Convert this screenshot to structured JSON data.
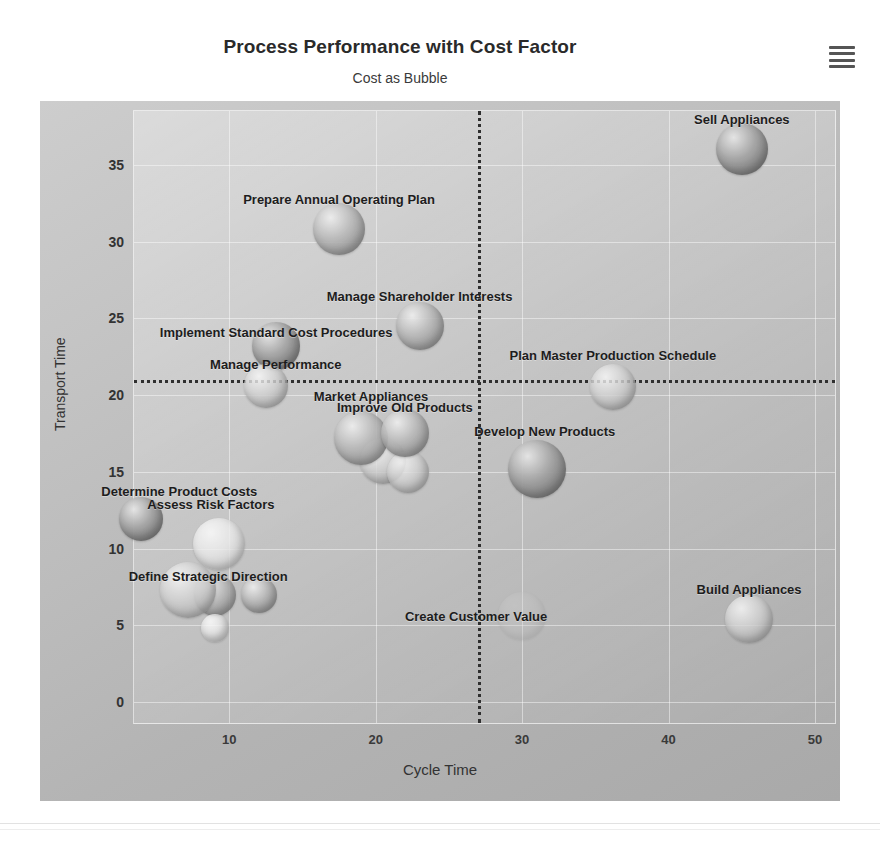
{
  "header": {
    "title": "Process Performance with Cost Factor",
    "subtitle": "Cost as Bubble",
    "menu_icon": "hamburger-menu-icon"
  },
  "colors": {
    "panel_background": "#bfbfbf",
    "plot_background": "#c8c8c8",
    "gridline": "#ffffff",
    "reference_line": "#2f2f2f",
    "label_text": "#1d1d1d",
    "title_text": "#2a2a2a",
    "bubble_fill": "#b9b9b9"
  },
  "chart_data": {
    "type": "scatter",
    "title": "Process Performance with Cost Factor",
    "subtitle": "Cost as Bubble",
    "xlabel": "Cycle Time",
    "ylabel": "Transport Time",
    "xlim": [
      3.5,
      51.5
    ],
    "ylim": [
      -1.5,
      38.5
    ],
    "xticks": [
      10,
      20,
      30,
      40,
      50
    ],
    "yticks": [
      0,
      5,
      10,
      15,
      20,
      25,
      30,
      35
    ],
    "grid": true,
    "legend": "none",
    "size_encoding": "Cost as Bubble",
    "reference_lines": [
      {
        "axis": "x",
        "value": 27,
        "style": "dotted"
      },
      {
        "axis": "y",
        "value": 21,
        "style": "dotted"
      }
    ],
    "points": [
      {
        "label": "Sell Appliances",
        "x": 45.0,
        "y": 36.0,
        "size": 26,
        "label_dx": 0,
        "label_dy": -30,
        "shade": "dark"
      },
      {
        "label": "Prepare Annual Operating Plan",
        "x": 17.5,
        "y": 30.8,
        "size": 26,
        "label_dx": 0,
        "label_dy": -30,
        "shade": "mid"
      },
      {
        "label": "Manage Shareholder Interests",
        "x": 23.0,
        "y": 24.5,
        "size": 24,
        "label_dx": 0,
        "label_dy": -30,
        "shade": "mid"
      },
      {
        "label": "Implement Standard Cost Procedures",
        "x": 13.2,
        "y": 23.2,
        "size": 24,
        "label_dx": 0,
        "label_dy": -14,
        "shade": "dark"
      },
      {
        "label": "Manage Performance",
        "x": 12.5,
        "y": 20.6,
        "size": 22,
        "label_dx": 10,
        "label_dy": -22,
        "shade": "light"
      },
      {
        "label": "Plan Master Production Schedule",
        "x": 36.2,
        "y": 20.5,
        "size": 23,
        "label_dx": 0,
        "label_dy": -32,
        "shade": "light"
      },
      {
        "label": "Market Appliances",
        "x": 19.0,
        "y": 17.2,
        "size": 27,
        "label_dx": 10,
        "label_dy": -42,
        "shade": "mid"
      },
      {
        "label": "Improve Old Products",
        "x": 22.0,
        "y": 17.5,
        "size": 24,
        "label_dx": 0,
        "label_dy": -26,
        "shade": "mid"
      },
      {
        "label": "Develop New Products",
        "x": 31.0,
        "y": 15.2,
        "size": 29,
        "label_dx": 8,
        "label_dy": -38,
        "shade": "dark"
      },
      {
        "label": "Determine Product Costs",
        "x": 4.0,
        "y": 11.9,
        "size": 22,
        "label_dx": 38,
        "label_dy": -28,
        "shade": "dark"
      },
      {
        "label": "Assess Risk Factors",
        "x": 9.3,
        "y": 10.3,
        "size": 26,
        "label_dx": -8,
        "label_dy": -40,
        "shade": "verylight"
      },
      {
        "label": "Define Strategic Direction",
        "x": 7.2,
        "y": 7.3,
        "size": 28,
        "label_dx": 20,
        "label_dy": -14,
        "shade": "light"
      },
      {
        "label": "Create Customer Value",
        "x": 30.0,
        "y": 5.6,
        "size": 24,
        "label_dx": -46,
        "label_dy": 0,
        "shade": "ghost"
      },
      {
        "label": "Build Appliances",
        "x": 45.5,
        "y": 5.4,
        "size": 24,
        "label_dx": 0,
        "label_dy": -30,
        "shade": "light"
      }
    ],
    "unlabeled_points": [
      {
        "x": 9.0,
        "y": 7.0,
        "size": 21,
        "shade": "mid"
      },
      {
        "x": 12.0,
        "y": 7.0,
        "size": 18,
        "shade": "mid"
      },
      {
        "x": 9.0,
        "y": 4.8,
        "size": 14,
        "shade": "verylight"
      },
      {
        "x": 20.5,
        "y": 15.7,
        "size": 23,
        "shade": "light"
      },
      {
        "x": 22.2,
        "y": 15.0,
        "size": 21,
        "shade": "light"
      }
    ]
  }
}
